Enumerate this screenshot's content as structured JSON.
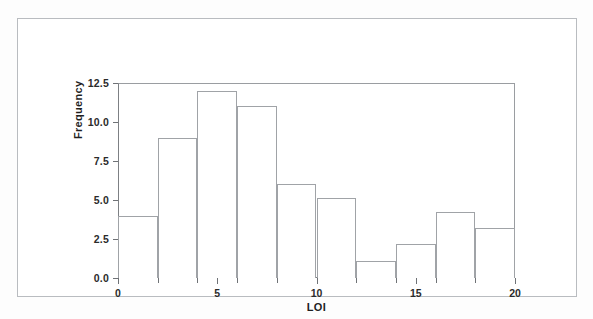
{
  "chart_data": {
    "type": "bar",
    "title": "",
    "subtitle": "",
    "xlabel": "LOI",
    "ylabel": "Frequency",
    "xlim": [
      0,
      20
    ],
    "ylim": [
      0,
      12.5
    ],
    "grid": false,
    "legend": null,
    "bin_width": 2,
    "categories": [
      "0-2",
      "2-4",
      "4-6",
      "6-8",
      "8-10",
      "10-12",
      "12-14",
      "14-16",
      "16-18",
      "18-20"
    ],
    "bin_edges": [
      0,
      2,
      4,
      6,
      8,
      10,
      12,
      14,
      16,
      18,
      20
    ],
    "values": [
      4,
      9,
      12,
      11,
      6,
      5.1,
      1.1,
      2.2,
      4.2,
      3.2
    ],
    "x_tick_labels": [
      "0",
      "5",
      "10",
      "15",
      "20"
    ],
    "x_tick_values": [
      0,
      5,
      10,
      15,
      20
    ],
    "x_minor_ticks": [
      2,
      4,
      6,
      8,
      12,
      14,
      16,
      18
    ],
    "y_tick_labels": [
      "0.0",
      "2.5",
      "5.0",
      "7.5",
      "10.0",
      "12.5"
    ],
    "y_tick_values": [
      0,
      2.5,
      5,
      7.5,
      10,
      12.5
    ],
    "colors": {
      "bar_fill": "#ffffff",
      "bar_outline": "#a0a3a7",
      "axis": "#7d8084",
      "text": "#1f1f1f",
      "background": "#ffffff",
      "frame": "#b9bcc0"
    }
  }
}
